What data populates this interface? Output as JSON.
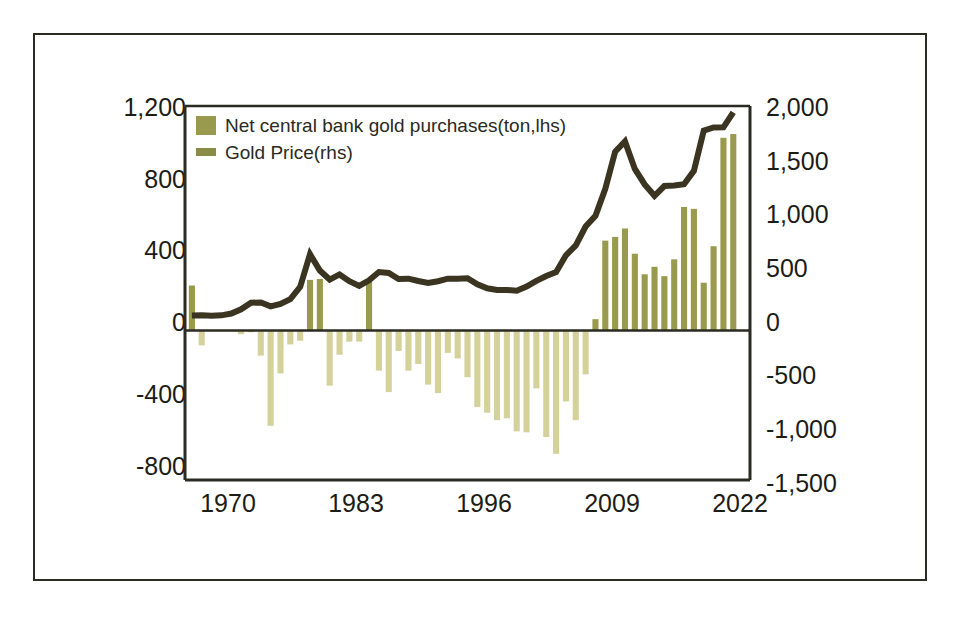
{
  "figure": {
    "background_color": "#ffffff",
    "frame_color": "#2b2b22"
  },
  "legend": {
    "items": [
      {
        "label": "Net central bank gold purchases(ton,lhs)",
        "marker": "bar-swatch",
        "color": "#999a4e"
      },
      {
        "label": "Gold Price(rhs)",
        "marker": "line-swatch",
        "color": "#3a3420"
      }
    ]
  },
  "chart_data": {
    "type": "bar",
    "title": "",
    "subtitle": "",
    "xlabel": "",
    "ylabel": "",
    "grid": false,
    "legend_position": "top-left",
    "colors": {
      "bar_positive": "#999a4e",
      "bar_negative": "#d4d19a",
      "line": "#3a3420",
      "axis": "#2b2b22",
      "text": "#1c1c16"
    },
    "x_axis": {
      "tick_labels": [
        "1970",
        "1983",
        "1996",
        "2009",
        "2022"
      ],
      "tick_values": [
        1970,
        1983,
        1996,
        2009,
        2022
      ],
      "range": [
        1967.3,
        2024.7
      ]
    },
    "y_axis_left": {
      "label": "Net central bank gold purchases (ton)",
      "tick_labels": [
        "1,200",
        "800",
        "400",
        "0",
        "-400",
        "-800"
      ],
      "tick_values": [
        1200,
        800,
        400,
        0,
        -400,
        -800
      ],
      "range": [
        -800,
        1200
      ]
    },
    "y_axis_right": {
      "label": "Gold Price (USD/oz)",
      "tick_labels": [
        "2,000",
        "1,500",
        "1,000",
        "500",
        "0",
        "-500",
        "-1,000",
        "-1,500"
      ],
      "tick_values": [
        2000,
        1500,
        1000,
        500,
        0,
        -500,
        -1000,
        -1500
      ],
      "range": [
        -1500,
        2000
      ]
    },
    "x": [
      1968,
      1969,
      1970,
      1971,
      1972,
      1973,
      1974,
      1975,
      1976,
      1977,
      1978,
      1979,
      1980,
      1981,
      1982,
      1983,
      1984,
      1985,
      1986,
      1987,
      1988,
      1989,
      1990,
      1991,
      1992,
      1993,
      1994,
      1995,
      1996,
      1997,
      1998,
      1999,
      2000,
      2001,
      2002,
      2003,
      2004,
      2005,
      2006,
      2007,
      2008,
      2009,
      2010,
      2011,
      2012,
      2013,
      2014,
      2015,
      2016,
      2017,
      2018,
      2019,
      2020,
      2021,
      2022,
      2023
    ],
    "series": [
      {
        "name": "Net central bank gold purchases(ton,lhs)",
        "axis": "left",
        "type": "bar",
        "unit": "ton",
        "values": [
          240,
          -80,
          0,
          -5,
          -5,
          -20,
          -10,
          -135,
          -510,
          -230,
          -75,
          -55,
          270,
          275,
          -295,
          -130,
          -60,
          -60,
          270,
          -215,
          -330,
          -110,
          -215,
          -180,
          -290,
          -335,
          -120,
          -150,
          -250,
          -410,
          -440,
          -480,
          -470,
          -540,
          -545,
          -310,
          -570,
          -660,
          -380,
          -480,
          -235,
          60,
          480,
          500,
          545,
          410,
          300,
          340,
          290,
          380,
          660,
          650,
          255,
          450,
          1030,
          1050
        ]
      },
      {
        "name": "Gold Price(rhs)",
        "axis": "right",
        "type": "line",
        "unit": "USD/oz",
        "values": [
          39,
          41,
          36,
          41,
          58,
          97,
          159,
          161,
          125,
          148,
          193,
          307,
          613,
          460,
          376,
          424,
          361,
          317,
          368,
          446,
          437,
          381,
          384,
          362,
          344,
          360,
          384,
          384,
          388,
          331,
          294,
          279,
          279,
          271,
          310,
          363,
          409,
          445,
          603,
          695,
          872,
          972,
          1225,
          1572,
          1669,
          1411,
          1266,
          1160,
          1251,
          1257,
          1268,
          1393,
          1770,
          1799,
          1800,
          1940
        ]
      }
    ],
    "annotations": []
  }
}
